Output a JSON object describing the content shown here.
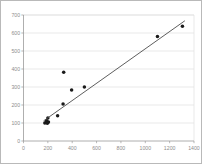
{
  "chart_data": {
    "type": "scatter",
    "title": "",
    "xlabel": "",
    "ylabel": "",
    "xlim": [
      0,
      1400
    ],
    "ylim": [
      0,
      700
    ],
    "grid": true,
    "legend": false,
    "xticks": [
      0,
      200,
      400,
      600,
      800,
      1000,
      1200,
      1400
    ],
    "yticks": [
      0,
      100,
      200,
      300,
      400,
      500,
      600,
      700
    ],
    "xtick_labels": [
      "0",
      "200",
      "400",
      "600",
      "800",
      "1000",
      "1200",
      "1400"
    ],
    "ytick_labels": [
      "0",
      "100",
      "200",
      "300",
      "400",
      "500",
      "600",
      "700"
    ],
    "series": [
      {
        "name": "observations",
        "type": "scatter",
        "marker": "circle",
        "color": "#1a1a1a",
        "points": [
          {
            "x": 175,
            "y": 100
          },
          {
            "x": 185,
            "y": 103
          },
          {
            "x": 190,
            "y": 112
          },
          {
            "x": 196,
            "y": 98
          },
          {
            "x": 200,
            "y": 128
          },
          {
            "x": 205,
            "y": 105
          },
          {
            "x": 280,
            "y": 140
          },
          {
            "x": 325,
            "y": 205
          },
          {
            "x": 330,
            "y": 382
          },
          {
            "x": 395,
            "y": 283
          },
          {
            "x": 500,
            "y": 300
          },
          {
            "x": 1100,
            "y": 580
          },
          {
            "x": 1305,
            "y": 637
          }
        ]
      },
      {
        "name": "trend-line",
        "type": "line",
        "color": "#4c4c4c",
        "points": [
          {
            "x": 165,
            "y": 112
          },
          {
            "x": 1325,
            "y": 668
          }
        ]
      }
    ]
  }
}
